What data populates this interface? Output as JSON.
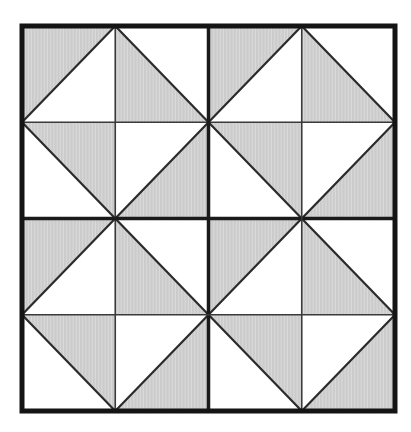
{
  "figure": {
    "canvas": {
      "width": 411,
      "height": 432,
      "background": "#ffffff"
    },
    "frame": {
      "x": 22,
      "y": 26,
      "width": 373,
      "height": 385
    },
    "colors": {
      "outer_border": "#141414",
      "quadrant_line": "#1a1a1a",
      "cell_line": "#3a3a3a",
      "diagonal_line": "#2b2b2b",
      "shade_base": "#cbcbcb",
      "shade_stripe": "#dadada",
      "unshaded": "#ffffff"
    },
    "line_widths": {
      "outer_border": 5,
      "quadrant_line": 3.5,
      "cell_line": 1.6,
      "diagonal_line": 2.2
    },
    "grid": {
      "rows": 4,
      "cols": 4
    },
    "cells": [
      [
        {
          "diagonal": "/",
          "shaded": "upper-left"
        },
        {
          "diagonal": "\\",
          "shaded": "lower-left"
        },
        {
          "diagonal": "/",
          "shaded": "upper-left"
        },
        {
          "diagonal": "\\",
          "shaded": "lower-left"
        }
      ],
      [
        {
          "diagonal": "\\",
          "shaded": "upper-right"
        },
        {
          "diagonal": "/",
          "shaded": "lower-right"
        },
        {
          "diagonal": "\\",
          "shaded": "upper-right"
        },
        {
          "diagonal": "/",
          "shaded": "lower-right"
        }
      ],
      [
        {
          "diagonal": "/",
          "shaded": "upper-left"
        },
        {
          "diagonal": "\\",
          "shaded": "lower-left"
        },
        {
          "diagonal": "/",
          "shaded": "upper-left"
        },
        {
          "diagonal": "\\",
          "shaded": "lower-left"
        }
      ],
      [
        {
          "diagonal": "\\",
          "shaded": "upper-right"
        },
        {
          "diagonal": "/",
          "shaded": "lower-right"
        },
        {
          "diagonal": "\\",
          "shaded": "upper-right"
        },
        {
          "diagonal": "/",
          "shaded": "lower-right"
        }
      ]
    ]
  }
}
